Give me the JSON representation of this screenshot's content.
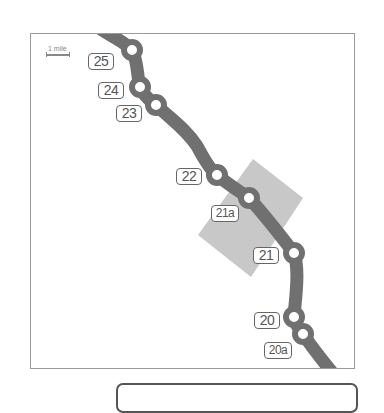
{
  "map": {
    "scale": {
      "label": "1 mile"
    },
    "colors": {
      "road": "#707070",
      "area": "#c8c8c8",
      "frame": "#9a9a9a",
      "label_border": "#666666"
    },
    "exits": [
      {
        "id": "25",
        "label": "25",
        "circle": [
          131,
          49
        ],
        "box": [
          87,
          52
        ]
      },
      {
        "id": "24",
        "label": "24",
        "circle": [
          139,
          86
        ],
        "box": [
          97,
          81
        ]
      },
      {
        "id": "23",
        "label": "23",
        "circle": [
          155,
          104
        ],
        "box": [
          115,
          104
        ]
      },
      {
        "id": "22",
        "label": "22",
        "circle": [
          216,
          174
        ],
        "box": [
          175,
          167
        ]
      },
      {
        "id": "21a",
        "label": "21a",
        "circle": [
          248,
          197
        ],
        "box": [
          210,
          204
        ]
      },
      {
        "id": "21",
        "label": "21",
        "circle": [
          293,
          252
        ],
        "box": [
          252,
          246
        ]
      },
      {
        "id": "20",
        "label": "20",
        "circle": [
          293,
          316
        ],
        "box": [
          253,
          311
        ]
      },
      {
        "id": "20a",
        "label": "20a",
        "circle": [
          302,
          333
        ],
        "box": [
          263,
          341
        ]
      }
    ]
  },
  "info_box": {
    "text": ""
  }
}
